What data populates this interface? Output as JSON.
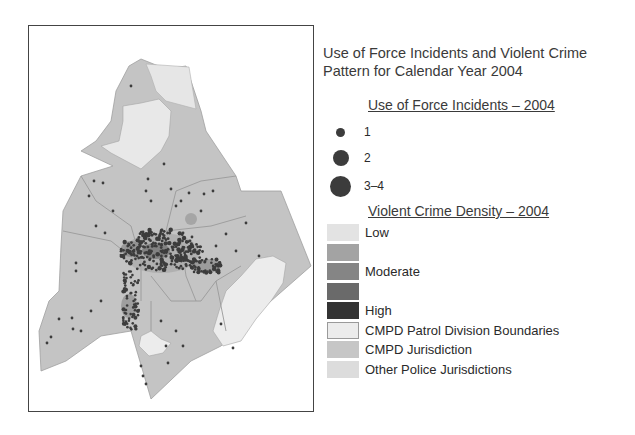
{
  "title": {
    "line1": "Use of Force Incidents and Violent Crime",
    "line2": "Pattern for Calendar Year 2004"
  },
  "legend": {
    "incidents": {
      "heading": "Use of Force Incidents – 2004",
      "items": [
        {
          "label": "1",
          "size": 9
        },
        {
          "label": "2",
          "size": 15
        },
        {
          "label": "3–4",
          "size": 20
        }
      ]
    },
    "density": {
      "heading": "Violent Crime Density – 2004",
      "items": [
        {
          "label": "Low",
          "color": "#e3e3e3"
        },
        {
          "label": "",
          "color": "#a3a3a3"
        },
        {
          "label": "Moderate",
          "color": "#858585"
        },
        {
          "label": "",
          "color": "#6a6a6a"
        },
        {
          "label": "High",
          "color": "#333333"
        },
        {
          "label": "CMPD Patrol Division Boundaries",
          "color": "#ececec",
          "border": "#9a9a9a"
        },
        {
          "label": "CMPD Jurisdiction",
          "color": "#c6c6c6"
        },
        {
          "label": "Other Police Jurisdictions",
          "color": "#dcdcdc"
        }
      ]
    }
  },
  "colors": {
    "jurisdiction": "#c4c4c4",
    "other": "#e6e6e6",
    "boundary": "#9a9a9a",
    "incident": "#3c3c3c"
  }
}
